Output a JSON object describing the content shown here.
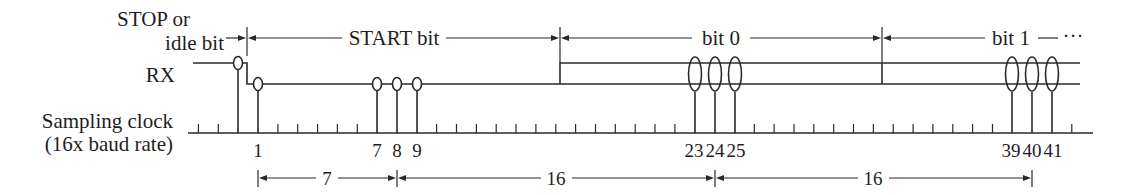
{
  "diagram": {
    "labels": {
      "stop_line1": "STOP or",
      "stop_line2": "idle bit",
      "rx": "RX",
      "clock_line1": "Sampling clock",
      "clock_line2": "(16x baud rate)"
    },
    "top_spans": [
      {
        "label": "START bit"
      },
      {
        "label": "bit 0"
      },
      {
        "label": "bit 1"
      },
      {
        "ellipsis": "···"
      }
    ],
    "sample_numbers": [
      "1",
      "7",
      "8",
      "9",
      "23",
      "24",
      "25",
      "39",
      "40",
      "41"
    ],
    "bottom_spans": [
      {
        "label": "7",
        "from_sample": "1",
        "to_sample": "8"
      },
      {
        "label": "16",
        "from_sample": "8",
        "to_sample": "24"
      },
      {
        "label": "16",
        "from_sample": "24",
        "to_sample": "40"
      }
    ],
    "signal": {
      "idle_level": "high",
      "start_bit_level": "low",
      "data_bits": "either (shown as both high and low)"
    },
    "clock": {
      "ratio": "16x baud rate",
      "samples_per_bit": 16,
      "majority_vote_samples_per_bit": 3
    }
  }
}
